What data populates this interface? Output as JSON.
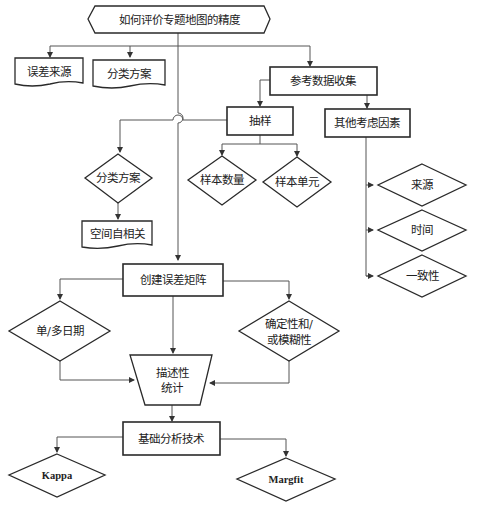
{
  "diagram": {
    "title": "如何评价专题地图的精度",
    "nodes": {
      "error_source": "误差来源",
      "classification_scheme_top": "分类方案",
      "reference_data_collection": "参考数据收集",
      "sampling": "抽样",
      "other_factors": "其他考虑因素",
      "classification_scheme_diamond": "分类方案",
      "spatial_autocorrelation": "空间自相关",
      "sample_size": "样本数量",
      "sample_unit": "样本单元",
      "source": "来源",
      "time": "时间",
      "consistency": "一致性",
      "error_matrix": "创建误差矩阵",
      "single_multi_date": "单/多日期",
      "deterministic_fuzzy_line1": "确定性和/",
      "deterministic_fuzzy_line2": "或模糊性",
      "descriptive_stats_line1": "描述性",
      "descriptive_stats_line2": "统计",
      "basic_analysis": "基础分析技术",
      "kappa": "Kappa",
      "margfit": "Margfit"
    },
    "colors": {
      "stroke": "#2a2a2a",
      "connector": "#555555",
      "background": "#ffffff"
    }
  }
}
